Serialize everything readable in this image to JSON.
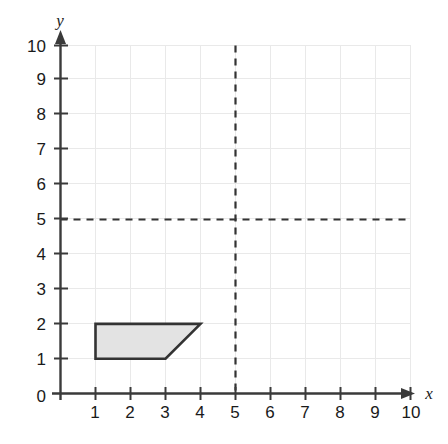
{
  "chart_data": {
    "type": "scatter",
    "title": "",
    "xlabel": "x",
    "ylabel": "y",
    "xlim": [
      0,
      10
    ],
    "ylim": [
      0,
      10
    ],
    "grid": true,
    "legend": null,
    "x_ticks": [
      "1",
      "2",
      "3",
      "4",
      "5",
      "6",
      "7",
      "8",
      "9",
      "10"
    ],
    "y_ticks": [
      "1",
      "2",
      "3",
      "4",
      "5",
      "6",
      "7",
      "8",
      "9",
      "10"
    ],
    "origin_label": "0",
    "shapes": [
      {
        "name": "trapezoid",
        "type": "polygon",
        "points": [
          [
            1,
            2
          ],
          [
            4,
            2
          ],
          [
            3,
            1
          ],
          [
            1,
            1
          ]
        ],
        "fill": "#e3e3e3",
        "stroke": "#333333"
      }
    ],
    "reference_lines": [
      {
        "name": "vertical-line-x5",
        "orientation": "vertical",
        "value": 5,
        "style": "dashed",
        "color": "#333333"
      },
      {
        "name": "horizontal-line-y5",
        "orientation": "horizontal",
        "value": 5,
        "style": "dashed",
        "color": "#333333"
      }
    ],
    "colors": {
      "grid": "#e9e9e9",
      "axis": "#3a3a3a",
      "shape_fill": "#e3e3e3",
      "shape_stroke": "#333333",
      "dash": "#333333",
      "text": "#1a1a1a",
      "background": "#ffffff"
    }
  }
}
